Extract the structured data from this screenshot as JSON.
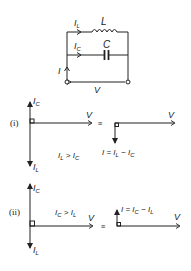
{
  "circuit": {
    "inductor_label": "L",
    "capacitor_label": "C",
    "current_L": {
      "main": "I",
      "sub": "L"
    },
    "current_C": {
      "main": "I",
      "sub": "C"
    },
    "current_total": "I",
    "voltage_label": "V"
  },
  "case_i": {
    "label": "(i)",
    "up_vector": {
      "main": "I",
      "sub": "C"
    },
    "down_vector": {
      "main": "I",
      "sub": "L"
    },
    "voltage_label": "V",
    "condition": {
      "a": "I",
      "a_sub": "L",
      "op": " > ",
      "b": "I",
      "b_sub": "C"
    },
    "equiv": "≡",
    "result_voltage_label": "V",
    "result": {
      "lhs": "I = ",
      "a": "I",
      "a_sub": "L",
      "op": " − ",
      "b": "I",
      "b_sub": "C"
    }
  },
  "case_ii": {
    "label": "(ii)",
    "up_vector": {
      "main": "I",
      "sub": "C"
    },
    "down_vector": {
      "main": "I",
      "sub": "L"
    },
    "voltage_label": "V",
    "condition": {
      "a": "I",
      "a_sub": "C",
      "op": " > ",
      "b": "I",
      "b_sub": "L"
    },
    "equiv": "≡",
    "result_voltage_label": "V",
    "result": {
      "lhs": "I = ",
      "a": "I",
      "a_sub": "C",
      "op": " − ",
      "b": "I",
      "b_sub": "L"
    }
  }
}
